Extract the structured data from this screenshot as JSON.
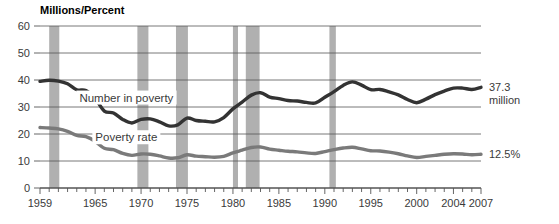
{
  "chart_data": {
    "type": "line",
    "title": "Millions/Percent",
    "xlabel": "",
    "ylabel": "",
    "ylim": [
      0,
      60
    ],
    "xlim": [
      1959,
      2007
    ],
    "yticks": [
      0,
      10,
      20,
      30,
      40,
      50,
      60
    ],
    "ytick_labels": [
      "0",
      "10",
      "20",
      "30",
      "40",
      "50",
      "60"
    ],
    "xtick_labels": [
      "1959",
      "1965",
      "1970",
      "1975",
      "1980",
      "1985",
      "1990",
      "1995",
      "2000",
      "2004",
      "2007"
    ],
    "xtick_values": [
      1959,
      1965,
      1970,
      1975,
      1980,
      1985,
      1990,
      1995,
      2000,
      2004,
      2007
    ],
    "minor_ticks": "every year 1959-2007",
    "grid": "horizontal",
    "legend_position": "inline-annotations",
    "annotations": [
      {
        "name": "number-in-poverty-label",
        "text": "Number in poverty",
        "x": 1968.4,
        "y": 33.5
      },
      {
        "name": "poverty-rate-label",
        "text": "Poverty rate",
        "x": 1968.4,
        "y": 18.8
      },
      {
        "name": "number-end-value",
        "text": "37.3",
        "x": 2007.8,
        "y": 37.3
      },
      {
        "name": "number-end-units",
        "text": "million",
        "x": 2007.8,
        "y": 32.5
      },
      {
        "name": "rate-end-value",
        "text": "12.5%",
        "x": 2007.8,
        "y": 12.5
      }
    ],
    "x": [
      1959,
      1960,
      1961,
      1962,
      1963,
      1964,
      1965,
      1966,
      1967,
      1968,
      1969,
      1970,
      1971,
      1972,
      1973,
      1974,
      1975,
      1976,
      1977,
      1978,
      1979,
      1980,
      1981,
      1982,
      1983,
      1984,
      1985,
      1986,
      1987,
      1988,
      1989,
      1990,
      1991,
      1992,
      1993,
      1994,
      1995,
      1996,
      1997,
      1998,
      1999,
      2000,
      2001,
      2002,
      2003,
      2004,
      2005,
      2006,
      2007
    ],
    "series": [
      {
        "name": "Number in poverty",
        "units": "millions",
        "color": "#333333",
        "end_value": 37.3,
        "end_label": "37.3 million",
        "values": [
          39.5,
          39.9,
          39.6,
          38.6,
          36.4,
          36.1,
          33.2,
          28.5,
          27.8,
          25.4,
          24.1,
          25.4,
          25.6,
          24.5,
          23.0,
          23.4,
          25.9,
          25.0,
          24.7,
          24.5,
          26.1,
          29.3,
          31.8,
          34.4,
          35.3,
          33.7,
          33.1,
          32.4,
          32.2,
          31.7,
          31.5,
          33.6,
          35.7,
          38.0,
          39.3,
          38.1,
          36.4,
          36.5,
          35.6,
          34.5,
          32.8,
          31.6,
          32.9,
          34.6,
          35.9,
          37.0,
          37.0,
          36.5,
          37.3
        ]
      },
      {
        "name": "Poverty rate",
        "units": "percent",
        "color": "#7a7a7a",
        "end_value": 12.5,
        "end_label": "12.5%",
        "values": [
          22.4,
          22.2,
          21.9,
          21.0,
          19.5,
          19.0,
          17.3,
          14.7,
          14.2,
          12.8,
          12.1,
          12.6,
          12.5,
          11.9,
          11.1,
          11.2,
          12.3,
          11.8,
          11.6,
          11.4,
          11.7,
          13.0,
          14.0,
          15.0,
          15.2,
          14.4,
          14.0,
          13.6,
          13.4,
          13.0,
          12.8,
          13.5,
          14.2,
          14.8,
          15.1,
          14.5,
          13.8,
          13.7,
          13.3,
          12.7,
          11.9,
          11.3,
          11.7,
          12.1,
          12.5,
          12.7,
          12.6,
          12.3,
          12.5
        ]
      }
    ],
    "recession_bands": [
      {
        "name": "recession-1960-61",
        "start": 1960.0,
        "end": 1961.1
      },
      {
        "name": "recession-1969-70",
        "start": 1969.6,
        "end": 1970.8
      },
      {
        "name": "recession-1973-75",
        "start": 1973.8,
        "end": 1975.1
      },
      {
        "name": "recession-1980",
        "start": 1980.0,
        "end": 1980.55
      },
      {
        "name": "recession-1981-82",
        "start": 1981.4,
        "end": 1982.9
      },
      {
        "name": "recession-1990-91",
        "start": 1990.5,
        "end": 1991.2
      }
    ],
    "band_color": "#b0b0b0"
  }
}
